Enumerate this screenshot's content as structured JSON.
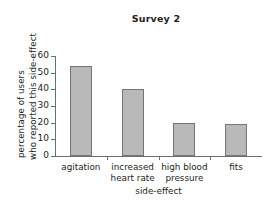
{
  "chart_data": {
    "type": "bar",
    "title": "Survey 2",
    "xlabel": "side-effect",
    "ylabel": "percentage of users who reported this side-effect",
    "ylabel_lines": [
      "percentage of users",
      "who reported this side-effect"
    ],
    "categories": [
      "agitation",
      "increased heart rate",
      "high blood pressure",
      "fits"
    ],
    "category_lines": [
      [
        "agitation"
      ],
      [
        "increased",
        "heart rate"
      ],
      [
        "high blood",
        "pressure"
      ],
      [
        "fits"
      ]
    ],
    "values": [
      54,
      40,
      20,
      19
    ],
    "ylim": [
      0,
      60
    ],
    "yticks": [
      0,
      10,
      20,
      30,
      40,
      50,
      60
    ],
    "ytick_labels": [
      "0",
      "10",
      "20",
      "30",
      "40",
      "50",
      "60"
    ],
    "grid": false,
    "legend": false,
    "bar_fill": "#b9b9b9",
    "bar_edge": "#757575",
    "axis_color": "#6e6e6e",
    "text_color": "#231f20",
    "background": "#ffffff"
  }
}
